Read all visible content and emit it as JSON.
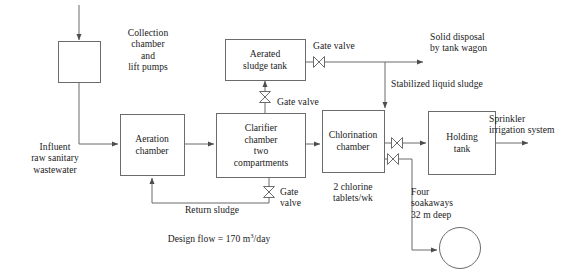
{
  "diagram": {
    "stroke_color": "#4d4d4d",
    "text_color": "#1a1a1a",
    "background_color": "#ffffff",
    "units": {
      "design_flow_value": "170",
      "design_flow_unit": "m3/day",
      "soakaway_depth": "32 m deep",
      "soakaway_count": "Four"
    },
    "nodes": [
      {
        "id": "collection-chamber",
        "label": "Collection\nchamber\nand\nlift pumps",
        "shape": "rect",
        "label_position": "right"
      },
      {
        "id": "aeration-chamber",
        "label": "Aeration\nchamber",
        "shape": "rect",
        "label_position": "inside"
      },
      {
        "id": "clarifier-chamber",
        "label": "Clarifier\nchamber\ntwo\ncompartments",
        "shape": "rect",
        "label_position": "inside"
      },
      {
        "id": "aerated-sludge-tank",
        "label": "Aerated\nsludge tank",
        "shape": "rect",
        "label_position": "inside"
      },
      {
        "id": "chlorination-chamber",
        "label": "Chlorination\nchamber",
        "shape": "rect",
        "label_position": "inside"
      },
      {
        "id": "holding-tank",
        "label": "Holding\ntank",
        "shape": "rect",
        "label_position": "inside"
      },
      {
        "id": "soakaway",
        "label": "",
        "shape": "circle",
        "label_position": "above-left"
      }
    ],
    "labels": {
      "collection_chamber": "Collection\nchamber\nand\nlift pumps",
      "aeration_chamber": "Aeration\nchamber",
      "clarifier_chamber": "Clarifier\nchamber\ntwo\ncompartments",
      "aerated_sludge_tank": "Aerated\nsludge tank",
      "chlorination_chamber": "Chlorination\nchamber",
      "holding_tank": "Holding\ntank",
      "influent": "Influent\nraw sanitary\nwastewater",
      "return_sludge": "Return sludge",
      "gate_valve_top": "Gate valve",
      "gate_valve_clarifier_top": "Gate valve",
      "gate_valve_clarifier_bottom": "Gate\nvalve",
      "solid_disposal": "Solid disposal\nby tank wagon",
      "stabilized_liquid_sludge": "Stabilized liquid sludge",
      "chlorine_dose": "2 chlorine\ntablets/wk",
      "sprinkler": "Sprinkler\nirrigation system",
      "soakaways": "Four\nsoakaways\n32 m deep",
      "design_flow_prefix": "Design flow = 170 m",
      "design_flow_exponent": "3",
      "design_flow_suffix": "/day"
    },
    "flows": [
      {
        "id": "inlet-to-collection",
        "from": "inlet",
        "to": "collection-chamber",
        "label": ""
      },
      {
        "id": "collection-to-aeration",
        "from": "collection-chamber",
        "to": "aeration-chamber",
        "label": "Influent raw sanitary wastewater"
      },
      {
        "id": "aeration-to-clarifier",
        "from": "aeration-chamber",
        "to": "clarifier-chamber",
        "label": ""
      },
      {
        "id": "clarifier-to-sludge-tank",
        "from": "clarifier-chamber",
        "to": "aerated-sludge-tank",
        "label": "Gate valve"
      },
      {
        "id": "clarifier-return-sludge",
        "from": "clarifier-chamber",
        "to": "aeration-chamber",
        "label": "Return sludge"
      },
      {
        "id": "sludge-tank-to-disposal",
        "from": "aerated-sludge-tank",
        "to": "solid-disposal",
        "label": "Solid disposal by tank wagon"
      },
      {
        "id": "sludge-tank-to-chlorination",
        "from": "aerated-sludge-tank",
        "to": "chlorination-chamber",
        "label": "Stabilized liquid sludge"
      },
      {
        "id": "clarifier-to-chlorination",
        "from": "clarifier-chamber",
        "to": "chlorination-chamber",
        "label": ""
      },
      {
        "id": "chlorination-to-holding",
        "from": "chlorination-chamber",
        "to": "holding-tank",
        "label": ""
      },
      {
        "id": "chlorination-to-soakaway",
        "from": "chlorination-chamber",
        "to": "soakaway",
        "label": "Four soakaways 32 m deep"
      },
      {
        "id": "holding-to-sprinkler",
        "from": "holding-tank",
        "to": "sprinkler",
        "label": "Sprinkler irrigation system"
      }
    ],
    "valves": [
      {
        "id": "valve-sludge-tank-outlet",
        "type": "gate-valve",
        "orientation": "horizontal",
        "label": "Gate valve"
      },
      {
        "id": "valve-clarifier-top",
        "type": "gate-valve",
        "orientation": "vertical",
        "label": "Gate valve"
      },
      {
        "id": "valve-clarifier-bottom",
        "type": "gate-valve",
        "orientation": "vertical",
        "label": "Gate valve"
      },
      {
        "id": "valve-holding-inlet",
        "type": "gate-valve",
        "orientation": "horizontal",
        "label": ""
      },
      {
        "id": "valve-soakaway-outlet",
        "type": "gate-valve",
        "orientation": "horizontal",
        "label": ""
      }
    ]
  }
}
